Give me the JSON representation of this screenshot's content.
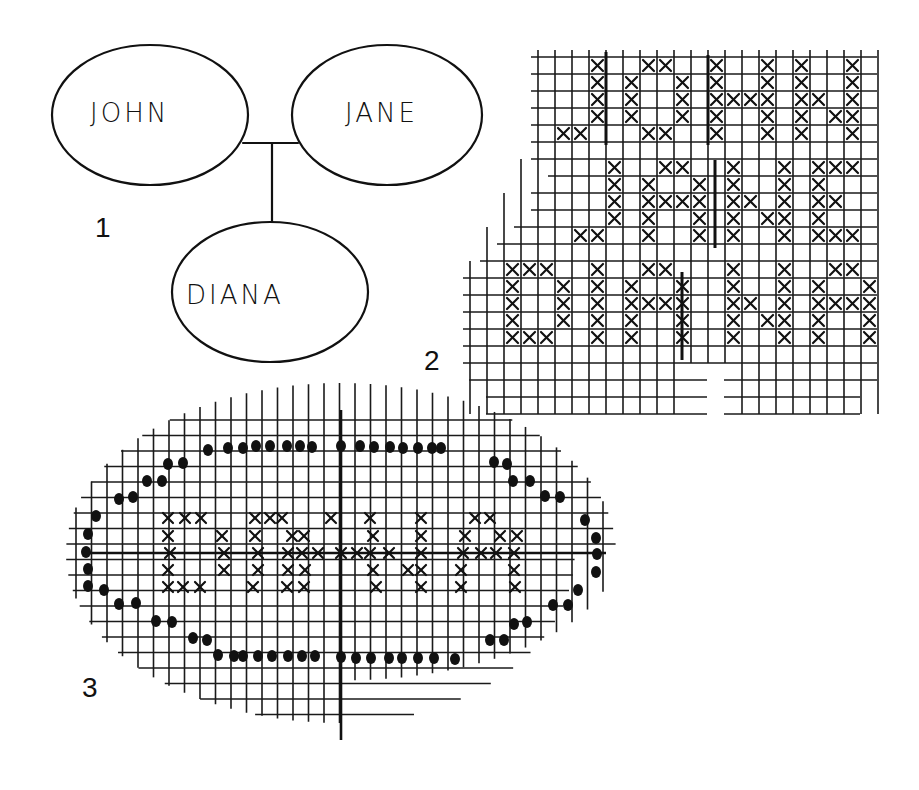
{
  "figure1": {
    "label": "1",
    "parents": [
      {
        "name": "JOHN",
        "cx": 150,
        "cy": 115,
        "rx": 98,
        "ry": 70
      },
      {
        "name": "JANE",
        "cx": 387,
        "cy": 115,
        "rx": 95,
        "ry": 70
      }
    ],
    "child": {
      "name": "DIANA",
      "cx": 270,
      "cy": 292,
      "rx": 98,
      "ry": 70
    },
    "connector": {
      "x1": 243,
      "x2": 298,
      "y": 143,
      "drop_x": 272,
      "drop_y2": 222
    }
  },
  "figure2": {
    "label": "2",
    "description": "Cross-stitch chart with names JOHN / JANE / DIANA in X stitches",
    "grid": {
      "x0": 469,
      "y0": 40,
      "cell": 17,
      "cols": 23,
      "rows": 21
    },
    "x_marks_rows": [
      {
        "row": 1,
        "cols": [
          7,
          10,
          11,
          14,
          17,
          19,
          22
        ]
      },
      {
        "row": 2,
        "cols": [
          7,
          9,
          12,
          14,
          17,
          19,
          22
        ]
      },
      {
        "row": 3,
        "cols": [
          7,
          9,
          12,
          14,
          15,
          16,
          17,
          19,
          20,
          22
        ]
      },
      {
        "row": 4,
        "cols": [
          7,
          9,
          12,
          14,
          17,
          19,
          21,
          22
        ]
      },
      {
        "row": 5,
        "cols": [
          5,
          6,
          10,
          11,
          14,
          17,
          19,
          22
        ]
      },
      {
        "row": 7,
        "cols": [
          8,
          11,
          12,
          15,
          18,
          20,
          21,
          22
        ]
      },
      {
        "row": 8,
        "cols": [
          8,
          10,
          13,
          15,
          18,
          20
        ]
      },
      {
        "row": 9,
        "cols": [
          8,
          10,
          11,
          12,
          13,
          15,
          16,
          18,
          20,
          21
        ]
      },
      {
        "row": 10,
        "cols": [
          8,
          10,
          13,
          15,
          17,
          18,
          20
        ]
      },
      {
        "row": 11,
        "cols": [
          6,
          7,
          10,
          13,
          15,
          18,
          20,
          21,
          22
        ]
      },
      {
        "row": 13,
        "cols": [
          2,
          3,
          4,
          7,
          10,
          11,
          15,
          18,
          21,
          22
        ]
      },
      {
        "row": 14,
        "cols": [
          2,
          5,
          7,
          9,
          12,
          15,
          18,
          20,
          23
        ]
      },
      {
        "row": 15,
        "cols": [
          2,
          5,
          7,
          9,
          10,
          11,
          12,
          15,
          16,
          18,
          20,
          21,
          22,
          23
        ]
      },
      {
        "row": 16,
        "cols": [
          2,
          5,
          7,
          9,
          12,
          15,
          17,
          18,
          20,
          23
        ]
      },
      {
        "row": 17,
        "cols": [
          2,
          3,
          4,
          7,
          9,
          12,
          15,
          18,
          20,
          23
        ]
      }
    ],
    "divider_lines": [
      {
        "x": 606,
        "y1": 52,
        "y2": 145
      },
      {
        "x": 708,
        "y1": 55,
        "y2": 145
      },
      {
        "x": 715,
        "y1": 160,
        "y2": 248
      },
      {
        "x": 682,
        "y1": 272,
        "y2": 360
      }
    ]
  },
  "figure3": {
    "label": "3",
    "description": "Oval cross-stitch chart with name DIANA inside a dotted oval border, with centre axes",
    "grid": {
      "x0": 55,
      "y0": 405,
      "cell": 15.5,
      "cols": 36,
      "rows": 21
    },
    "center": {
      "x": 341,
      "y": 553
    },
    "axes": {
      "h_x1": 86,
      "h_x2": 606,
      "v_y1": 410,
      "v_y2": 740
    },
    "x_marks_rows": [
      {
        "row": 0,
        "y": 518,
        "xs": [
          168,
          185,
          201,
          255,
          270,
          282,
          331,
          370,
          421,
          475,
          490
        ]
      },
      {
        "row": 1,
        "y": 536,
        "xs": [
          168,
          222,
          255,
          292,
          304,
          373,
          421,
          465,
          500,
          517
        ]
      },
      {
        "row": 2,
        "y": 553,
        "xs": [
          170,
          224,
          258,
          288,
          302,
          318,
          341,
          357,
          370,
          389,
          421,
          463,
          481,
          496,
          514
        ]
      },
      {
        "row": 3,
        "y": 570,
        "xs": [
          168,
          224,
          258,
          288,
          305,
          373,
          408,
          421,
          461,
          514
        ]
      },
      {
        "row": 4,
        "y": 587,
        "xs": [
          168,
          183,
          200,
          253,
          287,
          304,
          376,
          421,
          461,
          515
        ]
      }
    ],
    "dots": [
      [
        208,
        450
      ],
      [
        228,
        448
      ],
      [
        243,
        448
      ],
      [
        256,
        446
      ],
      [
        270,
        446
      ],
      [
        287,
        446
      ],
      [
        300,
        446
      ],
      [
        312,
        447
      ],
      [
        341,
        446
      ],
      [
        360,
        446
      ],
      [
        374,
        447
      ],
      [
        390,
        447
      ],
      [
        403,
        448
      ],
      [
        418,
        448
      ],
      [
        432,
        448
      ],
      [
        441,
        448
      ],
      [
        168,
        464
      ],
      [
        183,
        463
      ],
      [
        494,
        462
      ],
      [
        507,
        464
      ],
      [
        147,
        481
      ],
      [
        162,
        481
      ],
      [
        513,
        481
      ],
      [
        530,
        481
      ],
      [
        119,
        499
      ],
      [
        133,
        497
      ],
      [
        545,
        496
      ],
      [
        560,
        497
      ],
      [
        96,
        516
      ],
      [
        585,
        520
      ],
      [
        88,
        534
      ],
      [
        596,
        538
      ],
      [
        86,
        552
      ],
      [
        597,
        554
      ],
      [
        88,
        569
      ],
      [
        596,
        572
      ],
      [
        88,
        586
      ],
      [
        104,
        590
      ],
      [
        578,
        590
      ],
      [
        119,
        604
      ],
      [
        136,
        603
      ],
      [
        553,
        605
      ],
      [
        568,
        605
      ],
      [
        156,
        621
      ],
      [
        172,
        622
      ],
      [
        514,
        624
      ],
      [
        527,
        622
      ],
      [
        193,
        638
      ],
      [
        207,
        640
      ],
      [
        490,
        640
      ],
      [
        504,
        640
      ],
      [
        218,
        655
      ],
      [
        234,
        656
      ],
      [
        243,
        656
      ],
      [
        258,
        656
      ],
      [
        272,
        656
      ],
      [
        288,
        656
      ],
      [
        302,
        656
      ],
      [
        315,
        656
      ],
      [
        341,
        657
      ],
      [
        356,
        658
      ],
      [
        371,
        658
      ],
      [
        389,
        658
      ],
      [
        402,
        658
      ],
      [
        418,
        658
      ],
      [
        434,
        658
      ],
      [
        455,
        659
      ]
    ]
  }
}
